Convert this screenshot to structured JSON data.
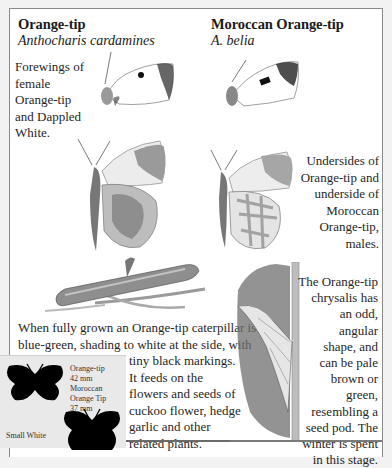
{
  "species_left": {
    "name": "Orange-tip",
    "latin": "Anthocharis cardamines"
  },
  "species_right": {
    "name": "Moroccan Orange-tip",
    "latin": "A. belia"
  },
  "captions": {
    "forewings": "Forewings of female Orange-tip and Dappled White.",
    "forewings_lines": [
      "Forewings of",
      "female",
      "Orange-tip",
      "and Dappled",
      "White."
    ],
    "undersides": "Undersides of Orange-tip and underside of Moroccan Orange-tip, males.",
    "undersides_lines": [
      "Undersides of",
      "Orange-tip and",
      "underside of",
      "Moroccan",
      "Orange-tip,",
      "males."
    ],
    "caterpillar_lines_full": [
      "When fully grown an Orange-tip caterpillar is",
      "blue-green, shading to white at the side, with"
    ],
    "caterpillar_lines_narrow": [
      "tiny black markings.",
      "It feeds on the",
      "flowers and seeds of",
      "cuckoo flower, hedge",
      "garlic and other",
      "related plants."
    ],
    "chrysalis_lines": [
      "The Orange-tip",
      "chrysalis has",
      "an odd,",
      "angular",
      "shape, and",
      "can be pale",
      "brown or",
      "green,",
      "resembling a",
      "seed pod. The",
      "winter is spent",
      "in this stage."
    ]
  },
  "size_panel": {
    "entries": [
      {
        "name": "Orange-tip",
        "size": "42 mm"
      },
      {
        "name": "Moroccan",
        "size": ""
      },
      {
        "name": "Orange Tip",
        "size": "37 mm"
      }
    ],
    "lines": [
      "Orange-tip",
      "42 mm",
      "Moroccan",
      "Orange Tip",
      "37 mm"
    ],
    "small_white_label": "Small White"
  },
  "illustrations": [
    {
      "id": "orange-tip-female-forewing",
      "icon": "butterfly-forewing-icon"
    },
    {
      "id": "dappled-white-forewing",
      "icon": "butterfly-forewing-icon"
    },
    {
      "id": "orange-tip-underside",
      "icon": "butterfly-underside-icon"
    },
    {
      "id": "moroccan-orange-tip-underside",
      "icon": "butterfly-underside-icon"
    },
    {
      "id": "orange-tip-caterpillar",
      "icon": "caterpillar-icon"
    },
    {
      "id": "orange-tip-chrysalis",
      "icon": "chrysalis-icon"
    }
  ],
  "colors": {
    "panel_border": "#8a8a8a",
    "size_panel_bg": "#e9e9e9",
    "silhouette": "#000000"
  }
}
